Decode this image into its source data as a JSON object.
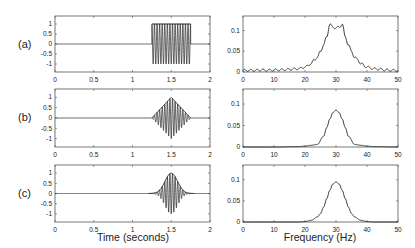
{
  "figure": {
    "row_labels": [
      "(a)",
      "(b)",
      "(c)"
    ],
    "left_xlabel": "Time (seconds)",
    "right_xlabel": "Frequency (Hz)"
  },
  "chart_data": [
    {
      "id": "a-time",
      "type": "line",
      "title": "",
      "row_label": "(a)",
      "xlabel": "",
      "ylabel": "",
      "xlim": [
        0,
        2
      ],
      "ylim": [
        -1.4,
        1.4
      ],
      "xticks": [
        "0",
        "0.5",
        "1",
        "1.5",
        "2"
      ],
      "yticks": [
        "-1",
        "-0.5",
        "0",
        "0.5",
        "1"
      ],
      "grid": false,
      "description": "30 Hz sinusoid with rectangular envelope (amplitude 1) from t=1.25 to t=1.75 s, zero elsewhere",
      "envelope": "rectangular",
      "carrier_hz": 30,
      "burst_start": 1.25,
      "burst_end": 1.75,
      "amplitude": 1
    },
    {
      "id": "a-freq",
      "type": "line",
      "title": "",
      "row_label": "(a)",
      "xlabel": "",
      "ylabel": "",
      "xlim": [
        0,
        50
      ],
      "ylim": [
        0,
        0.135
      ],
      "xticks": [
        "0",
        "10",
        "20",
        "30",
        "40",
        "50"
      ],
      "yticks": [
        "0",
        "0.05",
        "0.1"
      ],
      "grid": false,
      "x": [
        0,
        2,
        4,
        6,
        8,
        10,
        12,
        14,
        16,
        18,
        20,
        22,
        23,
        24,
        25,
        26,
        27,
        28,
        29,
        30,
        31,
        32,
        33,
        34,
        35,
        36,
        37,
        38,
        40,
        42,
        44,
        46,
        48,
        50
      ],
      "values": [
        0.004,
        0.004,
        0.004,
        0.005,
        0.004,
        0.005,
        0.005,
        0.006,
        0.007,
        0.008,
        0.012,
        0.02,
        0.03,
        0.035,
        0.05,
        0.065,
        0.085,
        0.115,
        0.108,
        0.106,
        0.108,
        0.115,
        0.085,
        0.065,
        0.05,
        0.035,
        0.03,
        0.02,
        0.012,
        0.008,
        0.007,
        0.005,
        0.004,
        0.004
      ]
    },
    {
      "id": "b-time",
      "type": "line",
      "row_label": "(b)",
      "xlim": [
        0,
        2
      ],
      "ylim": [
        -1.4,
        1.4
      ],
      "xticks": [
        "0",
        "0.5",
        "1",
        "1.5",
        "2"
      ],
      "yticks": [
        "-1",
        "-0.5",
        "0",
        "0.5",
        "1"
      ],
      "grid": false,
      "description": "30 Hz sinusoid with triangular envelope peaking at t=1.5 s, from 1.25 to 1.75 s",
      "envelope": "triangular",
      "carrier_hz": 30,
      "burst_start": 1.25,
      "burst_end": 1.75,
      "amplitude": 1
    },
    {
      "id": "b-freq",
      "type": "line",
      "row_label": "(b)",
      "xlim": [
        0,
        50
      ],
      "ylim": [
        0,
        0.135
      ],
      "xticks": [
        "0",
        "10",
        "20",
        "30",
        "40",
        "50"
      ],
      "yticks": [
        "0",
        "0.05",
        "0.1"
      ],
      "grid": false,
      "x": [
        0,
        10,
        18,
        20,
        22,
        24,
        26,
        27,
        28,
        29,
        30,
        31,
        32,
        33,
        34,
        36,
        38,
        40,
        42,
        50
      ],
      "values": [
        0.0,
        0.0,
        0.001,
        0.002,
        0.004,
        0.006,
        0.025,
        0.045,
        0.065,
        0.08,
        0.086,
        0.08,
        0.065,
        0.045,
        0.025,
        0.006,
        0.004,
        0.002,
        0.001,
        0.0
      ]
    },
    {
      "id": "c-time",
      "type": "line",
      "row_label": "(c)",
      "xlabel": "Time (seconds)",
      "xlim": [
        0,
        2
      ],
      "ylim": [
        -1.4,
        1.4
      ],
      "xticks": [
        "0",
        "0.5",
        "1",
        "1.5",
        "2"
      ],
      "yticks": [
        "-1",
        "-0.5",
        "0",
        "0.5",
        "1"
      ],
      "grid": false,
      "description": "30 Hz sinusoid with Gaussian envelope centered at t=1.5 s",
      "envelope": "gaussian",
      "carrier_hz": 30,
      "center": 1.5,
      "amplitude": 1
    },
    {
      "id": "c-freq",
      "type": "line",
      "row_label": "(c)",
      "xlabel": "Frequency (Hz)",
      "xlim": [
        0,
        50
      ],
      "ylim": [
        0,
        0.135
      ],
      "xticks": [
        "0",
        "10",
        "20",
        "30",
        "40",
        "50"
      ],
      "yticks": [
        "0",
        "0.05",
        "0.1"
      ],
      "grid": false,
      "x": [
        0,
        10,
        18,
        20,
        22,
        24,
        25,
        26,
        27,
        28,
        29,
        30,
        31,
        32,
        33,
        34,
        35,
        36,
        38,
        40,
        42,
        50
      ],
      "values": [
        0.0,
        0.0,
        0.0,
        0.001,
        0.004,
        0.012,
        0.02,
        0.035,
        0.055,
        0.075,
        0.09,
        0.095,
        0.09,
        0.075,
        0.055,
        0.035,
        0.02,
        0.012,
        0.004,
        0.001,
        0.0,
        0.0
      ]
    }
  ]
}
